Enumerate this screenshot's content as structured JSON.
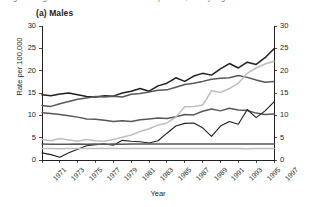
{
  "figure": {
    "cut_caption": "Figure 1  Age-standardised incidence rates per 100,000 by region",
    "panel_title": "(a) Males"
  },
  "chart_data": {
    "type": "line",
    "title": "(a) Males",
    "xlabel": "Year",
    "ylabel": "Rate per 100,000",
    "ylabel_right": "Rate per 100,000",
    "xlim": [
      1971,
      1997
    ],
    "ylim": [
      0,
      30
    ],
    "yticks": [
      0,
      5,
      10,
      15,
      20,
      25,
      30
    ],
    "yticks_right": [
      0,
      5,
      10,
      15,
      20,
      25,
      30
    ],
    "grid": false,
    "legend": "none",
    "x": [
      1971,
      1972,
      1973,
      1974,
      1975,
      1976,
      1977,
      1978,
      1979,
      1980,
      1981,
      1982,
      1983,
      1984,
      1985,
      1986,
      1987,
      1988,
      1989,
      1990,
      1991,
      1992,
      1993,
      1994,
      1995,
      1996,
      1997
    ],
    "xticks": [
      1971,
      1973,
      1975,
      1977,
      1979,
      1981,
      1983,
      1985,
      1987,
      1989,
      1991,
      1993,
      1995,
      1997
    ],
    "xticklabels": [
      "1971",
      "1973",
      "1975",
      "1977",
      "1979",
      "1981",
      "1983",
      "1985",
      "1987",
      "1989",
      "1991",
      "1993",
      "1995",
      "1997"
    ],
    "series": [
      {
        "name": "series-1",
        "color": "#231f20",
        "width": 1.5,
        "values": [
          14.6,
          14.4,
          14.8,
          15.0,
          14.6,
          14.2,
          14.1,
          14.4,
          14.3,
          15.0,
          15.4,
          16.0,
          15.4,
          16.6,
          17.2,
          18.4,
          17.6,
          18.8,
          19.4,
          19.0,
          20.4,
          21.6,
          20.6,
          21.9,
          21.4,
          22.9,
          24.9
        ]
      },
      {
        "name": "series-2",
        "color": "#58585b",
        "width": 1.5,
        "values": [
          12.2,
          12.0,
          12.6,
          13.1,
          13.6,
          13.9,
          14.2,
          14.1,
          14.3,
          14.1,
          14.7,
          14.9,
          15.2,
          15.6,
          15.7,
          16.3,
          16.9,
          17.2,
          17.6,
          18.1,
          18.3,
          18.4,
          18.9,
          18.5,
          17.9,
          17.4,
          17.6
        ]
      },
      {
        "name": "series-3",
        "color": "#58585b",
        "width": 1.5,
        "values": [
          10.6,
          10.4,
          10.2,
          9.9,
          9.6,
          9.2,
          9.1,
          8.9,
          8.6,
          8.8,
          8.6,
          9.0,
          9.2,
          9.4,
          9.3,
          9.7,
          10.2,
          10.1,
          10.9,
          11.4,
          11.0,
          11.6,
          11.2,
          11.1,
          10.5,
          10.2,
          10.3
        ]
      },
      {
        "name": "series-4",
        "color": "#bcbec0",
        "width": 1.5,
        "values": [
          4.6,
          4.3,
          4.8,
          4.5,
          4.2,
          4.6,
          4.3,
          4.2,
          4.6,
          5.1,
          5.6,
          6.4,
          7.0,
          7.8,
          8.3,
          9.6,
          11.9,
          12.0,
          12.3,
          15.5,
          15.1,
          16.0,
          17.2,
          19.4,
          20.6,
          21.5,
          22.1
        ]
      },
      {
        "name": "series-5",
        "color": "#231f20",
        "width": 1.1,
        "values": [
          1.6,
          1.2,
          0.6,
          1.6,
          2.4,
          3.2,
          3.4,
          3.6,
          3.3,
          4.4,
          4.2,
          4.1,
          3.8,
          4.3,
          6.0,
          7.6,
          8.2,
          8.3,
          7.2,
          5.3,
          7.6,
          8.6,
          8.0,
          11.3,
          9.5,
          11.0,
          13.0
        ]
      },
      {
        "name": "series-6",
        "color": "#58585b",
        "width": 1.5,
        "values": [
          3.6,
          3.5,
          3.5,
          3.5,
          3.6,
          3.5,
          3.6,
          3.5,
          3.6,
          3.5,
          3.6,
          3.6,
          3.6,
          3.6,
          3.6,
          3.6,
          3.6,
          3.6,
          3.6,
          3.6,
          3.6,
          3.6,
          3.6,
          3.6,
          3.6,
          3.6,
          3.6
        ]
      },
      {
        "name": "series-7",
        "color": "#bcbec0",
        "width": 1.5,
        "values": [
          2.6,
          2.6,
          2.5,
          2.6,
          2.6,
          2.6,
          2.6,
          2.6,
          2.6,
          2.6,
          2.6,
          2.6,
          2.6,
          2.6,
          2.6,
          2.6,
          2.6,
          2.6,
          2.6,
          2.6,
          2.6,
          2.6,
          2.6,
          2.5,
          2.6,
          2.6,
          2.6
        ]
      }
    ]
  }
}
